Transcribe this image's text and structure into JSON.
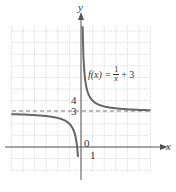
{
  "chart_data": {
    "type": "line",
    "title": "",
    "function_label": "f(x) = 1/x + 3",
    "xlabel": "x",
    "ylabel": "y",
    "asymptotes": {
      "horizontal": 3,
      "vertical": 0
    },
    "tick_labels": {
      "x": [
        "1"
      ],
      "y": [
        "3",
        "4"
      ],
      "origin": "0"
    },
    "xlim": [
      -6,
      6
    ],
    "ylim": [
      -2,
      10
    ],
    "grid": true,
    "series": [
      {
        "name": "f(x) = 1/x + 3 (x<0)",
        "x": [
          -6,
          -4,
          -2,
          -1,
          -0.5,
          -0.33,
          -0.25
        ],
        "y": [
          2.83,
          2.75,
          2.5,
          2,
          1,
          0,
          -1
        ]
      },
      {
        "name": "f(x) = 1/x + 3 (x>0)",
        "x": [
          0.14,
          0.2,
          0.5,
          1,
          2,
          4,
          6
        ],
        "y": [
          10,
          8,
          5,
          4,
          3.5,
          3.25,
          3.17
        ]
      }
    ]
  },
  "labels": {
    "x_axis": "x",
    "y_axis": "y",
    "origin": "0",
    "tick_x1": "1",
    "tick_y3": "3",
    "tick_y4": "4",
    "func_f": "f(x) =",
    "func_num": "1",
    "func_den": "x",
    "func_tail": "+ 3"
  }
}
